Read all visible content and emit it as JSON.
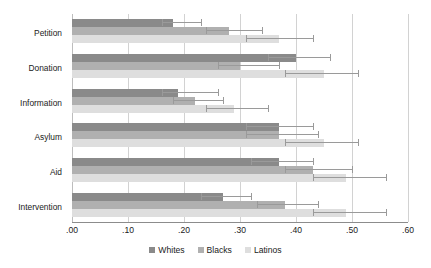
{
  "chart_data": {
    "type": "bar",
    "orientation": "horizontal",
    "title": "",
    "xlabel": "",
    "ylabel": "",
    "xlim": [
      0.0,
      0.6
    ],
    "grid": true,
    "legend_position": "bottom",
    "xticks": [
      0.0,
      0.1,
      0.2,
      0.3,
      0.4,
      0.5,
      0.6
    ],
    "xtick_labels": [
      ".00",
      ".10",
      ".20",
      ".30",
      ".40",
      ".50",
      ".60"
    ],
    "categories": [
      "Petition",
      "Donation",
      "Information",
      "Asylum",
      "Aid",
      "Intervention"
    ],
    "series": [
      {
        "name": "Whites",
        "color": "#8a8a8a",
        "values": [
          0.18,
          0.4,
          0.19,
          0.37,
          0.37,
          0.27
        ],
        "error_low": [
          0.16,
          0.35,
          0.16,
          0.31,
          0.32,
          0.23
        ],
        "error_high": [
          0.23,
          0.46,
          0.26,
          0.43,
          0.43,
          0.32
        ]
      },
      {
        "name": "Blacks",
        "color": "#b0b0b0",
        "values": [
          0.28,
          0.3,
          0.22,
          0.37,
          0.43,
          0.38
        ],
        "error_low": [
          0.24,
          0.26,
          0.18,
          0.31,
          0.38,
          0.33
        ],
        "error_high": [
          0.34,
          0.37,
          0.27,
          0.44,
          0.5,
          0.44
        ]
      },
      {
        "name": "Latinos",
        "color": "#dedede",
        "values": [
          0.37,
          0.45,
          0.29,
          0.45,
          0.49,
          0.49
        ],
        "error_low": [
          0.31,
          0.38,
          0.24,
          0.38,
          0.43,
          0.43
        ],
        "error_high": [
          0.43,
          0.51,
          0.35,
          0.51,
          0.56,
          0.56
        ]
      }
    ]
  }
}
